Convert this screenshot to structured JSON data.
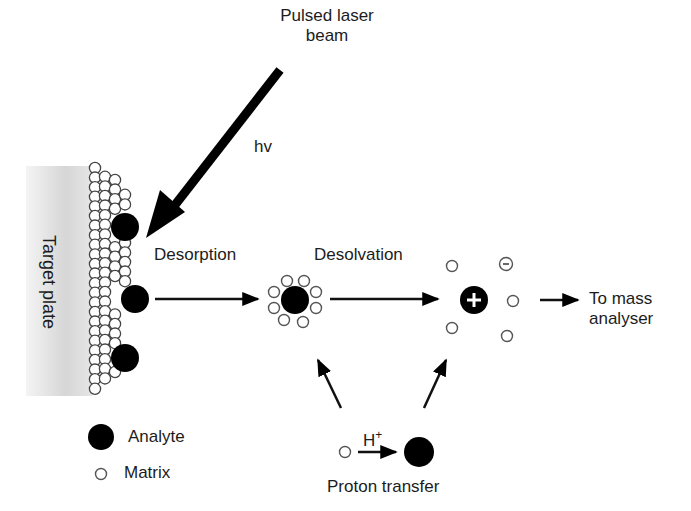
{
  "diagram": {
    "labels": {
      "laser": "Pulsed laser\nbeam",
      "laser_line1": "Pulsed laser",
      "laser_line2": "beam",
      "photon": "hv",
      "target_plate": "Target plate",
      "desorption": "Desorption",
      "desolvation": "Desolvation",
      "to_mass_line1": "To mass",
      "to_mass_line2": "analyser",
      "proton": "H",
      "proton_charge": "+",
      "proton_transfer": "Proton transfer",
      "positive_ion": "+",
      "negative_ion": "−"
    },
    "legend": [
      {
        "symbol": "filled-circle",
        "label": "Analyte"
      },
      {
        "symbol": "open-circle",
        "label": "Matrix"
      }
    ],
    "colors": {
      "ink": "#000000",
      "matrix_stroke": "#555555",
      "plate_gradient_start": "#ffffff",
      "plate_gradient_end": "#d8d8d8"
    }
  }
}
